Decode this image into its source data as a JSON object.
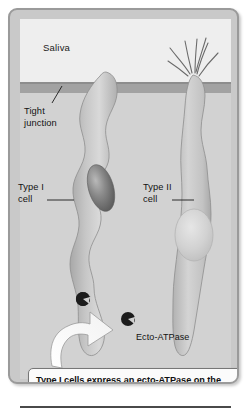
{
  "figure": {
    "regions": {
      "saliva_label": "Saliva",
      "tissue_label": ""
    },
    "labels": {
      "tight_junction": "Tight\njunction",
      "type_i_cell": "Type I\ncell",
      "type_ii_cell": "Type II\ncell",
      "ecto_atpase": "Ecto-ATPase"
    },
    "caption": "Type I cells express an ecto-ATPase on the cell surface that terminates gustatory signaling.",
    "icons": {
      "ecto_atpase_marker": "pacman-receptor-icon",
      "callout_arrow": "curved-arrow-icon",
      "microvilli": "microvilli-icon"
    },
    "colors": {
      "frame_border": "#9a9a9a",
      "frame_fill": "#c9c9c9",
      "saliva_fill": "#eeeeee",
      "tight_junction_fill": "#a2a2a2",
      "tissue_fill": "#d2d2d2",
      "cell_fill": "#bdbdbd",
      "type_i_nucleus": "#6f6f6f",
      "type_ii_nucleus": "#d8d8d8",
      "ecto_atpase_marker": "#1c1c1c",
      "caption_bg": "#fbfbfb",
      "text": "#131313",
      "rule": "#4a4a4a"
    }
  }
}
